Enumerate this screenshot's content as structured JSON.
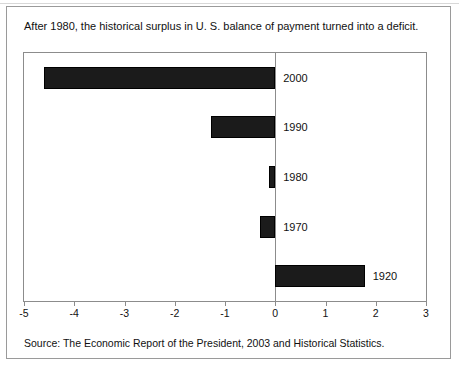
{
  "caption": "After 1980, the historical surplus in U. S. balance of payment turned into a deficit.",
  "source": "Source: The Economic Report of the President, 2003 and Historical Statistics.",
  "chart_data": {
    "type": "bar",
    "orientation": "horizontal",
    "title": "",
    "subtitle": "",
    "xlabel": "",
    "ylabel": "",
    "xlim": [
      -5,
      3
    ],
    "xticks": [
      -5,
      -4,
      -3,
      -2,
      -1,
      0,
      1,
      2,
      3
    ],
    "xticklabels": [
      "-5",
      "-4",
      "-3",
      "-2",
      "-1",
      "0",
      "1",
      "2",
      "3"
    ],
    "grid": false,
    "legend": false,
    "bar_color": "#1b1b1b",
    "categories": [
      "2000",
      "1990",
      "1980",
      "1970",
      "1920"
    ],
    "values": [
      -4.6,
      -1.28,
      -0.12,
      -0.3,
      1.78
    ],
    "bars": [
      {
        "label": "2000",
        "value": -4.6
      },
      {
        "label": "1990",
        "value": -1.28
      },
      {
        "label": "1980",
        "value": -0.12
      },
      {
        "label": "1970",
        "value": -0.3
      },
      {
        "label": "1920",
        "value": 1.78
      }
    ]
  }
}
